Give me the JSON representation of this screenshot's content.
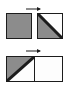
{
  "diagram": {
    "background_color": "#ffffff",
    "stroke_color": "#1c1c1c",
    "fill_gray": "#8c8c8c",
    "fill_white": "#fdfdfd",
    "rows": [
      {
        "name": "top-row",
        "arrow": {
          "label": "",
          "direction": "right"
        },
        "shapes": [
          {
            "name": "gray-square",
            "kind": "square",
            "fill": "solid-gray",
            "description": "solid gray square"
          },
          {
            "name": "diagonal-square",
            "kind": "square",
            "fill": "diagonal-split",
            "diagonal": "top-right-to-bottom-left",
            "filled_triangle": "lower-left",
            "description": "square split by diagonal, lower-left triangle gray, upper-right white"
          }
        ]
      },
      {
        "name": "bottom-row",
        "arrow": {
          "label": "",
          "direction": "right"
        },
        "shapes": [
          {
            "name": "wide-rectangle",
            "kind": "rectangle",
            "halves": [
              {
                "name": "left-half",
                "fill": "diagonal-split",
                "diagonal": "top-left-to-bottom-right",
                "filled_triangle": "upper-left",
                "description": "left half split by diagonal, upper-left triangle gray, lower-right white"
              },
              {
                "name": "right-half",
                "fill": "white",
                "description": "right half plain white"
              }
            ]
          }
        ]
      }
    ]
  }
}
